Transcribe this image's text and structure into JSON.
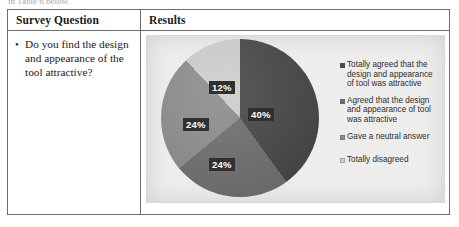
{
  "caption_cutoff": "in Table 6 below.",
  "table": {
    "headers": {
      "question": "Survey Question",
      "results": "Results"
    },
    "question": {
      "bullet": "•",
      "text": "Do you find the design and appearance of the tool attractive?"
    }
  },
  "chart_data": {
    "type": "pie",
    "title": "",
    "categories": [
      "Totally agreed that the design and appearance of tool was attractive",
      "Agreed that the design and appearance of tool was attractive",
      "Gave a neutral answer",
      "Totally disagreed"
    ],
    "values": [
      40,
      24,
      24,
      12
    ],
    "value_labels": [
      "40%",
      "24%",
      "24%",
      "12%"
    ],
    "colors": [
      "#484848",
      "#6f6f6f",
      "#8e8e8c",
      "#cfcfcd"
    ],
    "legend_position": "right",
    "grid": false,
    "units": "percent",
    "start_angle_deg": 0,
    "direction": "clockwise"
  }
}
